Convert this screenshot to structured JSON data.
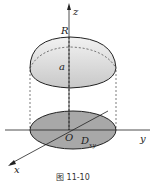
{
  "figure": {
    "caption": "图 11-10",
    "labels": {
      "z_axis": "z",
      "y_axis": "y",
      "x_axis": "x",
      "origin": "O",
      "radius": "R",
      "height": "a",
      "region": "D",
      "region_sub": "xy"
    },
    "colors": {
      "cap_fill": "#d9d9d9",
      "base_fill": "#a8a8a8",
      "stroke": "#222222"
    }
  }
}
